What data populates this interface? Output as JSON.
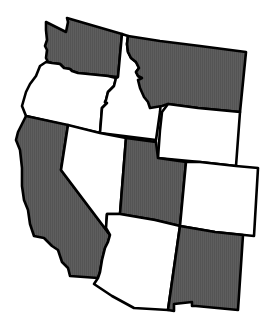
{
  "map": {
    "title": "Western United States",
    "colors": {
      "shaded": "#5a5a5a",
      "unshaded": "#ffffff",
      "border": "#000000"
    },
    "states": [
      {
        "id": "washington",
        "name": "Washington",
        "shaded": true
      },
      {
        "id": "oregon",
        "name": "Oregon",
        "shaded": false
      },
      {
        "id": "idaho",
        "name": "Idaho",
        "shaded": false
      },
      {
        "id": "montana",
        "name": "Montana",
        "shaded": true
      },
      {
        "id": "wyoming",
        "name": "Wyoming",
        "shaded": false
      },
      {
        "id": "california",
        "name": "California",
        "shaded": true
      },
      {
        "id": "nevada",
        "name": "Nevada",
        "shaded": false
      },
      {
        "id": "utah",
        "name": "Utah",
        "shaded": true
      },
      {
        "id": "colorado",
        "name": "Colorado",
        "shaded": false
      },
      {
        "id": "arizona",
        "name": "Arizona",
        "shaded": false
      },
      {
        "id": "new-mexico",
        "name": "New Mexico",
        "shaded": true
      }
    ]
  }
}
